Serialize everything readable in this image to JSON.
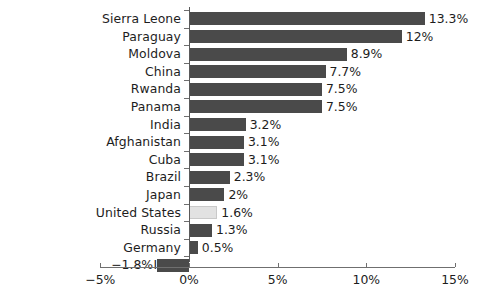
{
  "chart_data": {
    "type": "bar",
    "orientation": "horizontal",
    "title": "",
    "xlabel": "",
    "ylabel": "",
    "xlim": [
      -5,
      15
    ],
    "grid": false,
    "legend": null,
    "xtick_labels": [
      "-5%",
      "0%",
      "5%",
      "10%",
      "15%"
    ],
    "xtick_values": [
      -5,
      0,
      5,
      10,
      15
    ],
    "categories": [
      "Sierra Leone",
      "Paraguay",
      "Moldova",
      "China",
      "Rwanda",
      "Panama",
      "India",
      "Afghanistan",
      "Cuba",
      "Brazil",
      "Japan",
      "United States",
      "Russia",
      "Germany",
      "Italy"
    ],
    "values": [
      13.3,
      12,
      8.9,
      7.7,
      7.5,
      7.5,
      3.2,
      3.1,
      3.1,
      2.3,
      2,
      1.6,
      1.3,
      0.5,
      -1.8
    ],
    "data_labels": [
      "13.3%",
      "12%",
      "8.9%",
      "7.7%",
      "7.5%",
      "7.5%",
      "3.2%",
      "3.1%",
      "3.1%",
      "2.3%",
      "2%",
      "1.6%",
      "1.3%",
      "0.5%",
      "−1.8%"
    ],
    "highlight_category": "United States",
    "colors": {
      "bar": "#4a4a4a",
      "bar_highlight": "#e2e2e2",
      "axis": "#6f6f6f",
      "text": "#1d1d1d",
      "background": "#ffffff"
    }
  }
}
